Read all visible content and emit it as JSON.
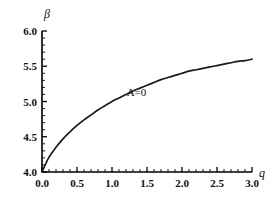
{
  "chart_data": {
    "type": "line",
    "title": "",
    "xlabel": "q",
    "ylabel": "β",
    "xlim": [
      0.0,
      3.0
    ],
    "ylim": [
      4.0,
      6.0
    ],
    "grid": false,
    "legend_position": "inline-annotation",
    "x_ticks": [
      "0.0",
      "0.5",
      "1.0",
      "1.5",
      "2.0",
      "2.5",
      "3.0"
    ],
    "x_tick_values": [
      0.0,
      0.5,
      1.0,
      1.5,
      2.0,
      2.5,
      3.0
    ],
    "y_ticks": [
      "4.0",
      "4.5",
      "5.0",
      "5.5",
      "6.0"
    ],
    "y_tick_values": [
      4.0,
      4.5,
      5.0,
      5.5,
      6.0
    ],
    "x_minor_interval": 0.1,
    "y_minor_interval": 0.1,
    "annotations": [
      {
        "text": "A=0",
        "x": 1.35,
        "y": 5.08
      }
    ],
    "series": [
      {
        "name": "A=0",
        "color": "#1a1a1a",
        "x": [
          0.0,
          0.1,
          0.2,
          0.3,
          0.4,
          0.5,
          0.6,
          0.7,
          0.8,
          0.9,
          1.0,
          1.1,
          1.2,
          1.3,
          1.4,
          1.5,
          1.6,
          1.7,
          1.8,
          1.9,
          2.0,
          2.1,
          2.2,
          2.3,
          2.4,
          2.5,
          2.6,
          2.7,
          2.8,
          2.9,
          3.0
        ],
        "values": [
          4.0,
          4.21,
          4.35,
          4.47,
          4.57,
          4.66,
          4.74,
          4.81,
          4.88,
          4.94,
          5.0,
          5.05,
          5.1,
          5.15,
          5.19,
          5.23,
          5.27,
          5.31,
          5.34,
          5.37,
          5.4,
          5.43,
          5.45,
          5.47,
          5.49,
          5.51,
          5.53,
          5.55,
          5.57,
          5.58,
          5.6
        ]
      }
    ]
  },
  "figure": {
    "background_color": "#ffffff",
    "axis_color": "#000000",
    "text_color": "#101010"
  }
}
